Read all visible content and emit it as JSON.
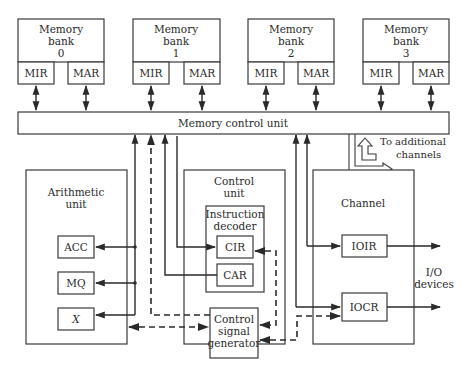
{
  "diagram": {
    "memory_banks": [
      {
        "title_line1": "Memory",
        "title_line2": "bank",
        "index": "0",
        "mir": "MIR",
        "mar": "MAR"
      },
      {
        "title_line1": "Memory",
        "title_line2": "bank",
        "index": "1",
        "mir": "MIR",
        "mar": "MAR"
      },
      {
        "title_line1": "Memory",
        "title_line2": "bank",
        "index": "2",
        "mir": "MIR",
        "mar": "MAR"
      },
      {
        "title_line1": "Memory",
        "title_line2": "bank",
        "index": "3",
        "mir": "MIR",
        "mar": "MAR"
      }
    ],
    "memory_control_unit": "Memory control unit",
    "additional_channels": {
      "line1": "To additional",
      "line2": "channels"
    },
    "arithmetic_unit": {
      "title_line1": "Arithmetic",
      "title_line2": "unit",
      "registers": [
        "ACC",
        "MQ",
        "X"
      ]
    },
    "control_unit": {
      "title_line1": "Control",
      "title_line2": "unit",
      "instruction_decoder": {
        "line1": "Instruction",
        "line2": "decoder"
      },
      "registers": [
        "CIR",
        "CAR"
      ],
      "signal_generator": {
        "line1": "Control",
        "line2": "signal",
        "line3": "generator"
      }
    },
    "channel": {
      "title": "Channel",
      "registers": [
        "IOIR",
        "IOCR"
      ],
      "io_label_line1": "I/O",
      "io_label_line2": "devices"
    }
  }
}
